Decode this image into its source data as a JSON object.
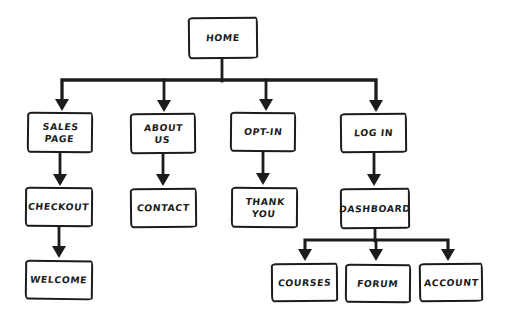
{
  "diagram": {
    "type": "sitemap-flowchart",
    "style": "hand-drawn-sketch",
    "colors": {
      "ink": "#1c1c1c",
      "background": "#ffffff"
    },
    "nodes": [
      {
        "id": "home",
        "label": "HOME"
      },
      {
        "id": "sales-page",
        "label": "SALES PAGE"
      },
      {
        "id": "about-us",
        "label": "ABOUT US"
      },
      {
        "id": "opt-in",
        "label": "OPT-IN"
      },
      {
        "id": "log-in",
        "label": "LOG IN"
      },
      {
        "id": "checkout",
        "label": "CHECKOUT"
      },
      {
        "id": "contact",
        "label": "CONTACT"
      },
      {
        "id": "thank-you",
        "label": "THANK YOU"
      },
      {
        "id": "dashboard",
        "label": "DASHBOARD"
      },
      {
        "id": "welcome",
        "label": "WELCOME"
      },
      {
        "id": "courses",
        "label": "COURSES"
      },
      {
        "id": "forum",
        "label": "FORUM"
      },
      {
        "id": "account",
        "label": "ACCOUNT"
      }
    ],
    "edges": [
      {
        "from": "home",
        "to": "sales-page"
      },
      {
        "from": "home",
        "to": "about-us"
      },
      {
        "from": "home",
        "to": "opt-in"
      },
      {
        "from": "home",
        "to": "log-in"
      },
      {
        "from": "sales-page",
        "to": "checkout"
      },
      {
        "from": "checkout",
        "to": "welcome"
      },
      {
        "from": "about-us",
        "to": "contact"
      },
      {
        "from": "opt-in",
        "to": "thank-you"
      },
      {
        "from": "log-in",
        "to": "dashboard"
      },
      {
        "from": "dashboard",
        "to": "courses"
      },
      {
        "from": "dashboard",
        "to": "forum"
      },
      {
        "from": "dashboard",
        "to": "account"
      }
    ]
  }
}
